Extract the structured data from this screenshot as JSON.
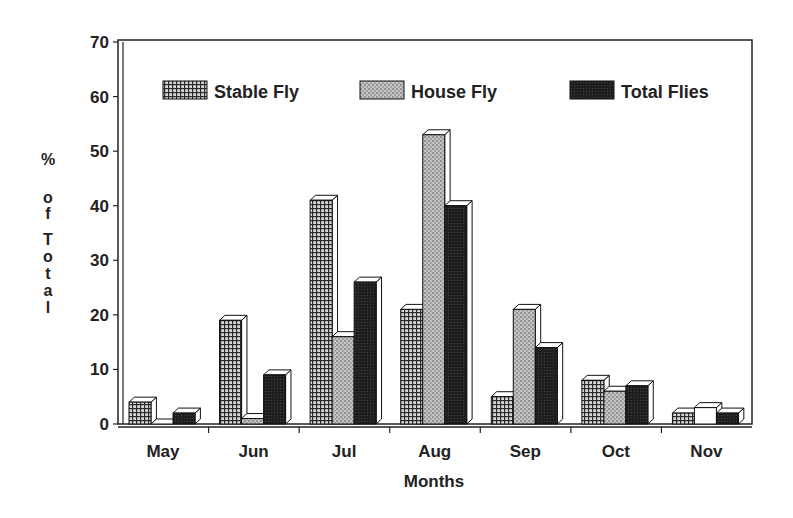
{
  "chart_data": {
    "type": "bar",
    "title": "",
    "xlabel": "Months",
    "ylabel": "% of Total",
    "ylim": [
      0,
      70
    ],
    "yticks": [
      0,
      10,
      20,
      30,
      40,
      50,
      60,
      70
    ],
    "grid": false,
    "legend_position": "top-inside",
    "categories": [
      "May",
      "Jun",
      "Jul",
      "Aug",
      "Sep",
      "Oct",
      "Nov"
    ],
    "series": [
      {
        "name": "Stable Fly",
        "pattern": "grid-dark",
        "values": [
          4,
          19,
          41,
          21,
          5,
          8,
          2
        ]
      },
      {
        "name": "House Fly",
        "pattern": "stipple-light",
        "values": [
          0,
          1,
          16,
          53,
          21,
          6,
          3
        ]
      },
      {
        "name": "Total Flies",
        "pattern": "solid-dark",
        "values": [
          2,
          9,
          26,
          40,
          14,
          7,
          2
        ]
      }
    ]
  },
  "colors": {
    "axis": "#222222",
    "stable": "#3a3a3a",
    "house": "#9a9a9a",
    "total": "#1e1e1e",
    "bar_side": "#ffffff"
  }
}
